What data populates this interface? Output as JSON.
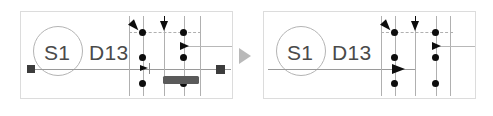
{
  "diagram": {
    "transition_icon": "play-triangle-icon",
    "panels": [
      {
        "id": "before",
        "role": "before-state",
        "node": {
          "circle_label": "S1",
          "side_label": "D13"
        },
        "has_left_square_marker": true,
        "has_right_square_marker": true,
        "has_activation_bar": true,
        "lifelines": [
          {
            "name": "lifeline-1",
            "x": 131,
            "dots": [
              3
            ]
          },
          {
            "name": "lifeline-2",
            "x": 148,
            "dots": [
              17,
              46,
              70
            ]
          },
          {
            "name": "lifeline-3",
            "x": 166,
            "dots": []
          },
          {
            "name": "lifeline-4",
            "x": 186,
            "dots": [
              17,
              46,
              70
            ]
          },
          {
            "name": "lifeline-5",
            "x": 202,
            "dots": []
          }
        ],
        "arrows": [
          {
            "name": "diagonal-arrow",
            "type": "diagonal"
          },
          {
            "name": "down-arrow",
            "type": "down"
          },
          {
            "name": "right-arrow-upper",
            "type": "right"
          },
          {
            "name": "right-arrow-lower",
            "type": "right"
          }
        ]
      },
      {
        "id": "after",
        "role": "after-state",
        "node": {
          "circle_label": "S1",
          "side_label": "D13"
        },
        "has_left_square_marker": false,
        "has_right_square_marker": false,
        "has_activation_bar": false,
        "lifelines": [
          {
            "name": "lifeline-1",
            "x": 140,
            "dots": []
          },
          {
            "name": "lifeline-2",
            "x": 156,
            "dots": [
              17,
              46,
              70
            ]
          },
          {
            "name": "lifeline-3",
            "x": 175,
            "dots": []
          },
          {
            "name": "lifeline-4",
            "x": 194,
            "dots": [
              17,
              46,
              70
            ]
          },
          {
            "name": "lifeline-5",
            "x": 208,
            "dots": []
          }
        ],
        "arrows": [
          {
            "name": "diagonal-arrow",
            "type": "diagonal"
          },
          {
            "name": "down-arrow",
            "type": "down"
          },
          {
            "name": "right-arrow-upper",
            "type": "right"
          },
          {
            "name": "right-arrow-lower",
            "type": "right"
          }
        ]
      }
    ],
    "colors": {
      "panel_border": "#dcdcdc",
      "lifeline": "#b0b0b0",
      "message_line": "#9a9a9a",
      "marker_fill": "#3c3c3c",
      "dot_fill": "#0d0d0d",
      "activation_fill": "#5a5a5a",
      "label_text": "#4a4a4a",
      "transition_arrow": "#b9b9b9"
    }
  }
}
